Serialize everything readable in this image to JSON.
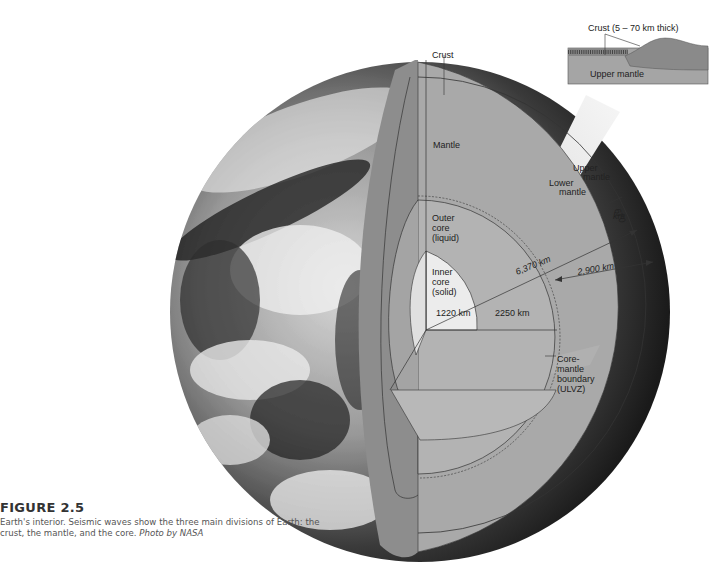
{
  "figure": {
    "title": "FIGURE 2.5",
    "caption": "Earth's interior. Seismic waves show the three main divisions of Earth: the crust, the mantle, and the core.",
    "credit": "Photo by NASA"
  },
  "labels": {
    "crust": "Crust",
    "mantle": "Mantle",
    "upper_mantle_1": "Upper",
    "upper_mantle_2": "mantle",
    "lower_mantle_1": "Lower",
    "lower_mantle_2": "mantle",
    "depth_670_1": "670",
    "depth_670_2": "km",
    "radius": "6,370 km",
    "mantle_thickness": "2,900 km",
    "outer_core_1": "Outer",
    "outer_core_2": "core",
    "outer_core_3": "(liquid)",
    "inner_core_1": "Inner",
    "inner_core_2": "core",
    "inner_core_3": "(solid)",
    "inner_radius": "1220 km",
    "outer_thickness": "2250 km",
    "cmb_1": "Core-",
    "cmb_2": "mantle",
    "cmb_3": "boundary",
    "cmb_4": "(ULVZ)"
  },
  "inset": {
    "crust_label": "Crust  (5 – 70 km thick)",
    "upper_mantle": "Upper mantle"
  },
  "colors": {
    "mantle": "#a9a9a9",
    "mantle_face": "#8f8f8f",
    "core": "#b4b4b4",
    "inner_core": "#ececec",
    "line": "#333333"
  }
}
